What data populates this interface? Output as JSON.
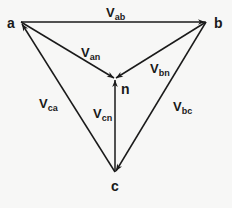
{
  "diagram": {
    "title": "",
    "nodes": [
      {
        "id": "a",
        "label": "a",
        "x": 21,
        "y": 22
      },
      {
        "id": "b",
        "label": "b",
        "x": 206,
        "y": 22
      },
      {
        "id": "n",
        "label": "n",
        "x": 115,
        "y": 79
      },
      {
        "id": "c",
        "label": "c",
        "x": 115,
        "y": 172
      }
    ],
    "edges": [
      {
        "from": "a",
        "to": "b",
        "label_main": "V",
        "label_sub": "ab"
      },
      {
        "from": "a",
        "to": "n",
        "label_main": "V",
        "label_sub": "an"
      },
      {
        "from": "b",
        "to": "n",
        "label_main": "V",
        "label_sub": "bn"
      },
      {
        "from": "c",
        "to": "a",
        "label_main": "V",
        "label_sub": "ca"
      },
      {
        "from": "c",
        "to": "n",
        "label_main": "V",
        "label_sub": "cn"
      },
      {
        "from": "b",
        "to": "c",
        "label_main": "V",
        "label_sub": "bc"
      }
    ],
    "colors": {
      "line": "#1a1a1a",
      "background": "#f7f7f6"
    }
  }
}
